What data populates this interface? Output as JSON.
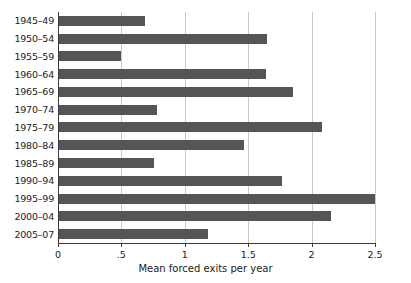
{
  "chart_data": {
    "type": "bar",
    "orientation": "horizontal",
    "title": "",
    "xlabel": "Mean forced exits per year",
    "ylabel": "",
    "categories": [
      "1945–49",
      "1950–54",
      "1955–59",
      "1960–64",
      "1965–69",
      "1970–74",
      "1975–79",
      "1980–84",
      "1985–89",
      "1990–94",
      "1995–99",
      "2000–04",
      "2005–07"
    ],
    "values": [
      0.69,
      1.65,
      0.5,
      1.64,
      1.85,
      0.78,
      2.08,
      1.47,
      0.76,
      1.77,
      2.51,
      2.15,
      1.18
    ],
    "xlim": [
      0,
      2.5
    ],
    "xticks": [
      0,
      0.5,
      1,
      1.5,
      2,
      2.5
    ],
    "xtick_labels": [
      "0",
      ".5",
      "1",
      "1.5",
      "2",
      "2.5"
    ],
    "grid": true,
    "grid_axis": "x",
    "legend": false,
    "bar_color": "#555555",
    "grid_color": "#c9c9c9",
    "axis_color": "#3a3a3a",
    "background": "#ffffff"
  }
}
